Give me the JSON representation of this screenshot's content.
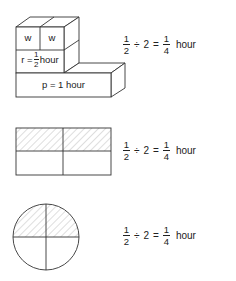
{
  "figures": [
    {
      "type": "block-model",
      "labels": {
        "w1": "w",
        "w2": "w",
        "r_prefix": "r =",
        "r_num": "1",
        "r_den": "2",
        "r_unit": "hour",
        "p": "p = 1 hour"
      },
      "equation": {
        "a_num": "1",
        "a_den": "2",
        "op": "÷",
        "b": "2",
        "eq": "=",
        "c_num": "1",
        "c_den": "4",
        "unit": "hour"
      }
    },
    {
      "type": "rectangle-area-model",
      "shaded": "top half",
      "equation": {
        "a_num": "1",
        "a_den": "2",
        "op": "÷",
        "b": "2",
        "eq": "=",
        "c_num": "1",
        "c_den": "4",
        "unit": "hour"
      }
    },
    {
      "type": "circle-area-model",
      "shaded": "top half",
      "equation": {
        "a_num": "1",
        "a_den": "2",
        "op": "÷",
        "b": "2",
        "eq": "=",
        "c_num": "1",
        "c_den": "4",
        "unit": "hour"
      }
    }
  ],
  "colors": {
    "line": "#333333",
    "hatch": "#bbbbbb",
    "background": "#ffffff"
  }
}
